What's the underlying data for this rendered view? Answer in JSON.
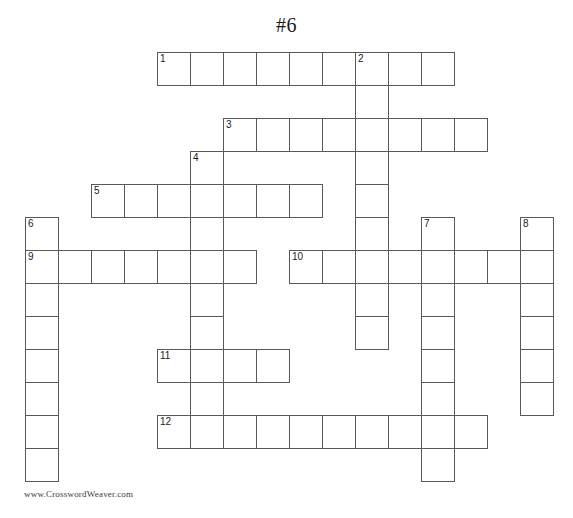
{
  "puzzle": {
    "title": "#6",
    "credit": "www.CrosswordWeaver.com",
    "cell_size": 33,
    "origin_x": 25,
    "origin_y": 52,
    "grid_cols": 16,
    "grid_rows": 14,
    "border_color": "#595959",
    "cell_fill": "#ffffff",
    "number_color": "#1a1a1a",
    "entries": [
      {
        "number": 1,
        "direction": "across",
        "col": 4,
        "row": 0,
        "length": 9
      },
      {
        "number": 2,
        "direction": "down",
        "col": 10,
        "row": 0,
        "length": 9
      },
      {
        "number": 3,
        "direction": "across",
        "col": 6,
        "row": 2,
        "length": 8
      },
      {
        "number": 4,
        "direction": "down",
        "col": 5,
        "row": 3,
        "length": 9
      },
      {
        "number": 5,
        "direction": "across",
        "col": 2,
        "row": 4,
        "length": 7
      },
      {
        "number": 6,
        "direction": "down",
        "col": 0,
        "row": 5,
        "length": 8
      },
      {
        "number": 7,
        "direction": "down",
        "col": 12,
        "row": 5,
        "length": 8
      },
      {
        "number": 8,
        "direction": "down",
        "col": 15,
        "row": 5,
        "length": 6
      },
      {
        "number": 9,
        "direction": "across",
        "col": 0,
        "row": 6,
        "length": 7
      },
      {
        "number": 10,
        "direction": "across",
        "col": 8,
        "row": 6,
        "length": 8
      },
      {
        "number": 11,
        "direction": "across",
        "col": 4,
        "row": 9,
        "length": 4
      },
      {
        "number": 12,
        "direction": "across",
        "col": 4,
        "row": 11,
        "length": 10
      }
    ],
    "numbered_cells": [
      {
        "number": 1,
        "col": 4,
        "row": 0
      },
      {
        "number": 2,
        "col": 10,
        "row": 0
      },
      {
        "number": 3,
        "col": 6,
        "row": 2
      },
      {
        "number": 4,
        "col": 5,
        "row": 3
      },
      {
        "number": 5,
        "col": 2,
        "row": 4
      },
      {
        "number": 6,
        "col": 0,
        "row": 5
      },
      {
        "number": 7,
        "col": 12,
        "row": 5
      },
      {
        "number": 8,
        "col": 15,
        "row": 5
      },
      {
        "number": 9,
        "col": 0,
        "row": 6
      },
      {
        "number": 10,
        "col": 8,
        "row": 6
      },
      {
        "number": 11,
        "col": 4,
        "row": 9
      },
      {
        "number": 12,
        "col": 4,
        "row": 11
      }
    ]
  }
}
